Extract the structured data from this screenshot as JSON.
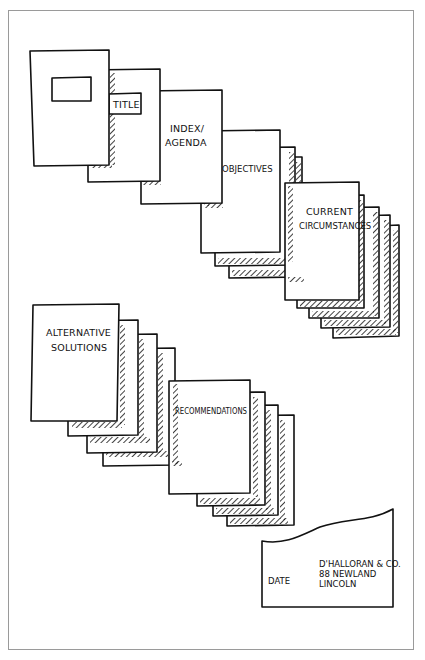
{
  "diagram": {
    "type": "report-structure-sketch",
    "sequence": [
      {
        "id": "cover",
        "label": "",
        "extra_sheets": 0
      },
      {
        "id": "title",
        "label": "TITLE",
        "extra_sheets": 0
      },
      {
        "id": "index",
        "label_lines": [
          "INDEX/",
          "AGENDA"
        ],
        "extra_sheets": 0
      },
      {
        "id": "objectives",
        "label": "OBJECTIVES",
        "extra_sheets": 2
      },
      {
        "id": "current-circumstances",
        "label_lines": [
          "CURRENT",
          "CIRCUMSTANCES"
        ],
        "extra_sheets": 4
      },
      {
        "id": "alternative-solutions",
        "label_lines": [
          "ALTERNATIVE",
          "SOLUTIONS"
        ],
        "extra_sheets": 3
      },
      {
        "id": "recommendations",
        "label": "RECOMMENDATIONS",
        "extra_sheets": 3
      },
      {
        "id": "back-page",
        "label": "DATE",
        "address_lines": [
          "D'HALLORAN & CO.",
          "88 NEWLAND",
          "LINCOLN"
        ]
      }
    ]
  },
  "labels": {
    "title": "TITLE",
    "index_line1": "INDEX/",
    "index_line2": "AGENDA",
    "objectives": "OBJECTIVES",
    "current_line1": "CURRENT",
    "current_line2": "CIRCUMSTANCES",
    "alternative_line1": "ALTERNATIVE",
    "alternative_line2": "SOLUTIONS",
    "recommendations": "RECOMMENDATIONS",
    "date": "DATE",
    "address_line1": "D'HALLORAN & CO.",
    "address_line2": "88 NEWLAND",
    "address_line3": "LINCOLN"
  },
  "colors": {
    "ink": "#111111",
    "paper": "#ffffff",
    "frame": "#9a9a9a"
  }
}
